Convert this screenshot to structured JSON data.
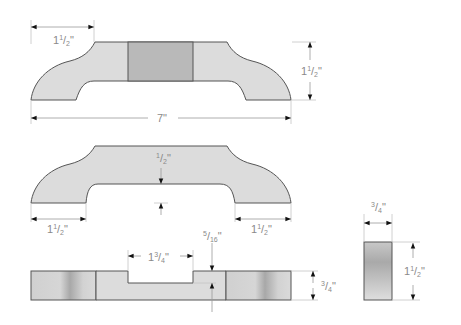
{
  "colors": {
    "light_fill": "#dcdcdc",
    "dark_fill": "#b9b9b9",
    "outline": "#555555",
    "dimension_text": "#8a8a8a",
    "arrow": "#111111"
  },
  "views": {
    "top_view": {
      "dims": {
        "end_width": {
          "whole": "1",
          "num": "1",
          "den": "2",
          "unit": "\""
        },
        "overall_length": {
          "text": "7\""
        },
        "height": {
          "whole": "1",
          "num": "1",
          "den": "2",
          "unit": "\""
        }
      }
    },
    "front_view": {
      "dims": {
        "rail_thickness": {
          "num": "1",
          "den": "2",
          "unit": "\""
        },
        "left_foot": {
          "whole": "1",
          "num": "1",
          "den": "2",
          "unit": "\""
        },
        "right_foot": {
          "whole": "1",
          "num": "1",
          "den": "2",
          "unit": "\""
        }
      }
    },
    "side_view": {
      "dims": {
        "notch_width": {
          "whole": "1",
          "num": "3",
          "den": "4",
          "unit": "\""
        },
        "notch_depth": {
          "num": "5",
          "den": "16",
          "unit": "\""
        },
        "thickness": {
          "num": "3",
          "den": "4",
          "unit": "\""
        }
      }
    },
    "end_view": {
      "dims": {
        "width": {
          "num": "3",
          "den": "4",
          "unit": "\""
        },
        "height": {
          "whole": "1",
          "num": "1",
          "den": "2",
          "unit": "\""
        }
      }
    }
  }
}
